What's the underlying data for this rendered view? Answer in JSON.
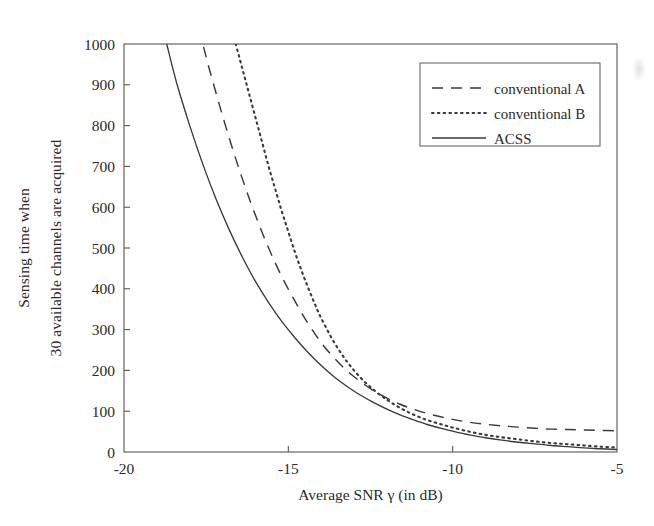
{
  "figure": {
    "background_color": "#ffffff",
    "ink_color": "#3a3a3a",
    "axis_color": "#555555"
  },
  "axes": {
    "x_label": "Average SNR γ (in dB)",
    "y_label_line1": "Sensing time when",
    "y_label_line2": "30 available channels are acquired",
    "x_ticks": [
      "-20",
      "-15",
      "-10",
      "-5"
    ],
    "y_ticks": [
      "0",
      "100",
      "200",
      "300",
      "400",
      "500",
      "600",
      "700",
      "800",
      "900",
      "1000"
    ]
  },
  "legend": {
    "position": "top-right",
    "entries": [
      {
        "label": "conventional A",
        "style": "dashed"
      },
      {
        "label": "conventional B",
        "style": "dotted"
      },
      {
        "label": "ACSS",
        "style": "solid"
      }
    ]
  },
  "chart_data": {
    "type": "line",
    "title": "",
    "xlabel": "Average SNR γ (in dB)",
    "ylabel": "Sensing time when 30 available channels are acquired",
    "xlim": [
      -20,
      -5
    ],
    "ylim": [
      0,
      1000
    ],
    "xticks": [
      -20,
      -15,
      -10,
      -5
    ],
    "yticks": [
      0,
      100,
      200,
      300,
      400,
      500,
      600,
      700,
      800,
      900,
      1000
    ],
    "grid": false,
    "legend_position": "upper right",
    "series": [
      {
        "name": "conventional A",
        "style": "dashed",
        "x": [
          -18.7,
          -18.4,
          -18.0,
          -17.6,
          -17.2,
          -16.8,
          -16.4,
          -16.0,
          -15.6,
          -15.2,
          -14.8,
          -14.4,
          -14.0,
          -13.6,
          -13.2,
          -12.8,
          -12.4,
          -12.0,
          -11.6,
          -11.2,
          -10.8,
          -10.4,
          -10.0,
          -9.5,
          -9.0,
          -8.5,
          -8.0,
          -7.5,
          -7.0,
          -6.5,
          -6.0,
          -5.5,
          -5.0
        ],
        "y": [
          1450,
          1300,
          1150,
          1000,
          880,
          770,
          670,
          580,
          500,
          430,
          370,
          315,
          268,
          230,
          198,
          172,
          150,
          132,
          117,
          105,
          95,
          87,
          80,
          73,
          68,
          64,
          61,
          58,
          56,
          55,
          54,
          53,
          52
        ]
      },
      {
        "name": "conventional B",
        "style": "dotted",
        "x": [
          -16.6,
          -16.4,
          -16.2,
          -16.0,
          -15.8,
          -15.6,
          -15.4,
          -15.2,
          -15.0,
          -14.8,
          -14.6,
          -14.4,
          -14.2,
          -14.0,
          -13.6,
          -13.2,
          -12.8,
          -12.4,
          -12.0,
          -11.6,
          -11.2,
          -10.8,
          -10.4,
          -10.0,
          -9.5,
          -9.0,
          -8.5,
          -8.0,
          -7.5,
          -7.0,
          -6.5,
          -6.0,
          -5.5,
          -5.0
        ],
        "y": [
          1000,
          940,
          880,
          820,
          760,
          700,
          645,
          590,
          540,
          490,
          445,
          403,
          364,
          328,
          268,
          220,
          182,
          152,
          128,
          108,
          92,
          79,
          69,
          60,
          50,
          42,
          36,
          31,
          26,
          22,
          19,
          16,
          13,
          11
        ]
      },
      {
        "name": "ACSS",
        "style": "solid",
        "x": [
          -18.7,
          -18.4,
          -18.0,
          -17.6,
          -17.2,
          -16.8,
          -16.4,
          -16.0,
          -15.6,
          -15.2,
          -14.8,
          -14.4,
          -14.0,
          -13.6,
          -13.2,
          -12.8,
          -12.4,
          -12.0,
          -11.6,
          -11.2,
          -10.8,
          -10.4,
          -10.0,
          -9.5,
          -9.0,
          -8.5,
          -8.0,
          -7.5,
          -7.0,
          -6.5,
          -6.0,
          -5.5,
          -5.0
        ],
        "y": [
          1000,
          905,
          800,
          705,
          620,
          545,
          478,
          418,
          366,
          320,
          280,
          244,
          212,
          184,
          160,
          139,
          121,
          105,
          91,
          79,
          68,
          59,
          51,
          42,
          35,
          29,
          24,
          20,
          16,
          13,
          10,
          8,
          6
        ]
      }
    ]
  }
}
